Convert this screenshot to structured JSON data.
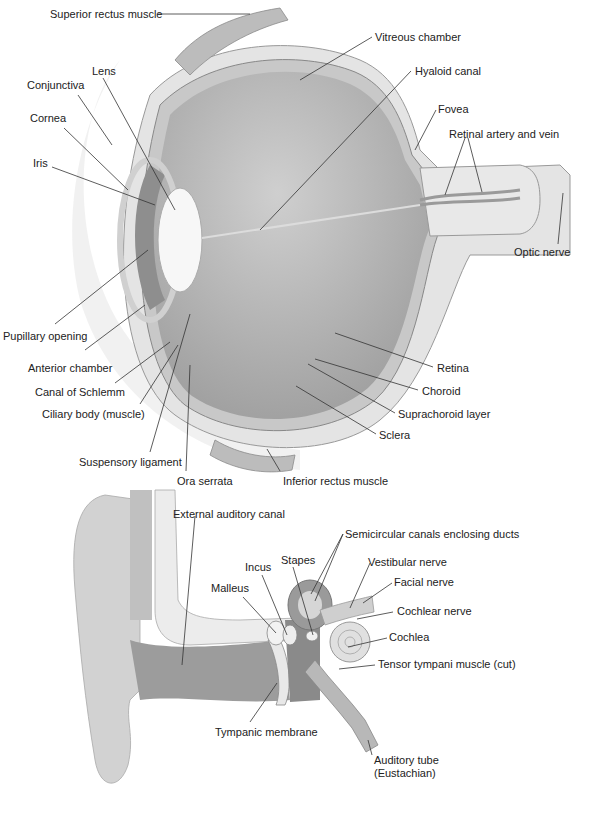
{
  "figures": [
    {
      "id": "eye",
      "name": "Eye cross-section",
      "labels": [
        {
          "text": "Superior rectus muscle",
          "x": 50,
          "y": 8
        },
        {
          "text": "Vitreous chamber",
          "x": 375,
          "y": 31
        },
        {
          "text": "Hyaloid canal",
          "x": 415,
          "y": 65
        },
        {
          "text": "Lens",
          "x": 92,
          "y": 65
        },
        {
          "text": "Conjunctiva",
          "x": 27,
          "y": 79
        },
        {
          "text": "Fovea",
          "x": 438,
          "y": 103
        },
        {
          "text": "Cornea",
          "x": 30,
          "y": 112
        },
        {
          "text": "Retinal artery and vein",
          "x": 449,
          "y": 128
        },
        {
          "text": "Iris",
          "x": 33,
          "y": 157
        },
        {
          "text": "Optic nerve",
          "x": 514,
          "y": 246
        },
        {
          "text": "Pupillary opening",
          "x": 3,
          "y": 330
        },
        {
          "text": "Anterior chamber",
          "x": 28,
          "y": 362
        },
        {
          "text": "Retina",
          "x": 437,
          "y": 362
        },
        {
          "text": "Canal of Schlemm",
          "x": 35,
          "y": 386
        },
        {
          "text": "Choroid",
          "x": 422,
          "y": 385
        },
        {
          "text": "Ciliary body (muscle)",
          "x": 42,
          "y": 408
        },
        {
          "text": "Suprachoroid layer",
          "x": 398,
          "y": 408
        },
        {
          "text": "Sclera",
          "x": 379,
          "y": 429
        },
        {
          "text": "Suspensory ligament",
          "x": 79,
          "y": 456
        },
        {
          "text": "Ora serrata",
          "x": 177,
          "y": 475
        },
        {
          "text": "Inferior rectus muscle",
          "x": 283,
          "y": 475
        }
      ]
    },
    {
      "id": "ear",
      "name": "Ear cross-section",
      "labels": [
        {
          "text": "External auditory canal",
          "x": 173,
          "y": 508
        },
        {
          "text": "Semicircular canals enclosing ducts",
          "x": 345,
          "y": 528
        },
        {
          "text": "Stapes",
          "x": 281,
          "y": 554
        },
        {
          "text": "Vestibular nerve",
          "x": 368,
          "y": 556
        },
        {
          "text": "Incus",
          "x": 245,
          "y": 561
        },
        {
          "text": "Malleus",
          "x": 211,
          "y": 582
        },
        {
          "text": "Facial nerve",
          "x": 394,
          "y": 576
        },
        {
          "text": "Cochlear nerve",
          "x": 397,
          "y": 605
        },
        {
          "text": "Cochlea",
          "x": 389,
          "y": 631
        },
        {
          "text": "Tensor tympani muscle (cut)",
          "x": 378,
          "y": 658
        },
        {
          "text": "Tympanic membrane",
          "x": 215,
          "y": 726
        },
        {
          "text": "Auditory tube\n(Eustachian)",
          "x": 374,
          "y": 754
        }
      ]
    }
  ],
  "colors": {
    "label_text": "#222222",
    "leader_line": "#333333",
    "tissue_light": "#e6e6e6",
    "tissue_mid": "#bdbdbd",
    "tissue_dark": "#8f8f8f",
    "vitreous": "#b8b8b8",
    "background": "#ffffff"
  }
}
